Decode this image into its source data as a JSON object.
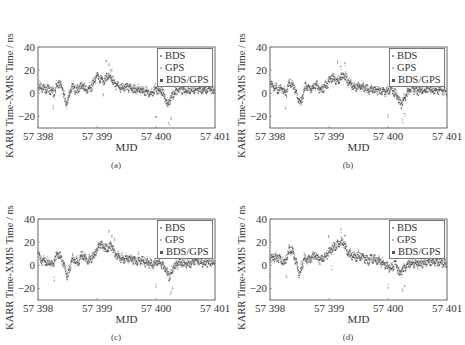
{
  "chart_data": [
    {
      "panel": "a",
      "type": "scatter",
      "caption": "(a)",
      "xlabel": "MJD",
      "ylabel": "KARR Time-XMIS Time / ns",
      "xlim": [
        57398,
        57401
      ],
      "ylim": [
        -30,
        40
      ],
      "xticks": [
        "57 398",
        "57 399",
        "57 400",
        "57 401"
      ],
      "yticks": [
        "40",
        "20",
        "0",
        "−20"
      ],
      "legend": [
        "BDS",
        "GPS",
        "BDS/GPS"
      ],
      "legend_position": "upper right",
      "grid": false,
      "trend": [
        [
          57398.0,
          6
        ],
        [
          57398.1,
          4
        ],
        [
          57398.2,
          3
        ],
        [
          57398.28,
          0
        ],
        [
          57398.33,
          9
        ],
        [
          57398.4,
          6
        ],
        [
          57398.48,
          -10
        ],
        [
          57398.58,
          6
        ],
        [
          57398.65,
          2
        ],
        [
          57398.75,
          7
        ],
        [
          57398.82,
          2
        ],
        [
          57398.9,
          5
        ],
        [
          57399.0,
          15
        ],
        [
          57399.1,
          10
        ],
        [
          57399.2,
          16
        ],
        [
          57399.3,
          8
        ],
        [
          57399.4,
          4
        ],
        [
          57399.5,
          6
        ],
        [
          57399.6,
          3
        ],
        [
          57399.7,
          3
        ],
        [
          57399.8,
          2
        ],
        [
          57399.9,
          0
        ],
        [
          57400.0,
          3
        ],
        [
          57400.1,
          2
        ],
        [
          57400.2,
          -10
        ],
        [
          57400.28,
          -2
        ],
        [
          57400.4,
          4
        ],
        [
          57400.5,
          2
        ],
        [
          57400.6,
          3
        ],
        [
          57400.7,
          4
        ],
        [
          57400.8,
          2
        ],
        [
          57400.9,
          3
        ],
        [
          57401.0,
          1
        ]
      ],
      "outliers": [
        [
          57398.26,
          -12
        ],
        [
          57399.15,
          26
        ],
        [
          57399.2,
          24
        ],
        [
          57399.25,
          21
        ],
        [
          57400.0,
          -20
        ],
        [
          57400.22,
          -26
        ],
        [
          57400.25,
          -22
        ],
        [
          57399.1,
          -2
        ]
      ]
    },
    {
      "panel": "b",
      "type": "scatter",
      "caption": "(b)",
      "xlabel": "MJD",
      "ylabel": "KARR Time-XMIS Time / ns",
      "xlim": [
        57398,
        57401
      ],
      "ylim": [
        -30,
        40
      ],
      "xticks": [
        "57 398",
        "57 399",
        "57 400",
        "57 401"
      ],
      "yticks": [
        "40",
        "20",
        "0",
        "−20"
      ],
      "legend": [
        "BDS",
        "GPS",
        "BDS/GPS"
      ],
      "legend_position": "upper right",
      "grid": false,
      "trend": [
        [
          57398.0,
          8
        ],
        [
          57398.1,
          4
        ],
        [
          57398.2,
          3
        ],
        [
          57398.28,
          0
        ],
        [
          57398.33,
          10
        ],
        [
          57398.4,
          6
        ],
        [
          57398.52,
          -10
        ],
        [
          57398.6,
          6
        ],
        [
          57398.7,
          3
        ],
        [
          57398.78,
          8
        ],
        [
          57398.85,
          3
        ],
        [
          57398.95,
          6
        ],
        [
          57399.05,
          14
        ],
        [
          57399.15,
          10
        ],
        [
          57399.25,
          16
        ],
        [
          57399.35,
          8
        ],
        [
          57399.45,
          5
        ],
        [
          57399.55,
          6
        ],
        [
          57399.65,
          3
        ],
        [
          57399.75,
          3
        ],
        [
          57399.85,
          2
        ],
        [
          57399.95,
          1
        ],
        [
          57400.05,
          3
        ],
        [
          57400.15,
          -2
        ],
        [
          57400.22,
          -10
        ],
        [
          57400.3,
          -2
        ],
        [
          57400.4,
          4
        ],
        [
          57400.5,
          2
        ],
        [
          57400.6,
          3
        ],
        [
          57400.7,
          4
        ],
        [
          57400.8,
          2
        ],
        [
          57400.9,
          3
        ],
        [
          57401.0,
          1
        ]
      ],
      "outliers": [
        [
          57398.26,
          -12
        ],
        [
          57399.15,
          26
        ],
        [
          57399.2,
          22
        ],
        [
          57399.27,
          25
        ],
        [
          57400.0,
          -20
        ],
        [
          57400.25,
          -24
        ],
        [
          57400.28,
          -18
        ],
        [
          57399.5,
          8
        ]
      ]
    },
    {
      "panel": "c",
      "type": "scatter",
      "caption": "(c)",
      "xlabel": "MJD",
      "ylabel": "KARR Time-XMIS Time / ns",
      "xlim": [
        57398,
        57401
      ],
      "ylim": [
        -30,
        40
      ],
      "xticks": [
        "57 398",
        "57 399",
        "57 400",
        "57 401"
      ],
      "yticks": [
        "40",
        "20",
        "0",
        "−20"
      ],
      "legend": [
        "BDS",
        "GPS",
        "BDS/GPS"
      ],
      "legend_position": "upper right",
      "grid": false,
      "trend": [
        [
          57398.0,
          10
        ],
        [
          57398.05,
          4
        ],
        [
          57398.15,
          3
        ],
        [
          57398.25,
          0
        ],
        [
          57398.33,
          10
        ],
        [
          57398.4,
          6
        ],
        [
          57398.5,
          -10
        ],
        [
          57398.58,
          5
        ],
        [
          57398.68,
          2
        ],
        [
          57398.75,
          9
        ],
        [
          57398.85,
          3
        ],
        [
          57398.95,
          8
        ],
        [
          57399.05,
          18
        ],
        [
          57399.15,
          14
        ],
        [
          57399.25,
          16
        ],
        [
          57399.32,
          8
        ],
        [
          57399.45,
          5
        ],
        [
          57399.55,
          6
        ],
        [
          57399.65,
          3
        ],
        [
          57399.75,
          4
        ],
        [
          57399.85,
          2
        ],
        [
          57399.95,
          1
        ],
        [
          57400.05,
          3
        ],
        [
          57400.15,
          -3
        ],
        [
          57400.22,
          -10
        ],
        [
          57400.3,
          -2
        ],
        [
          57400.4,
          2
        ],
        [
          57400.5,
          1
        ],
        [
          57400.6,
          2
        ],
        [
          57400.7,
          4
        ],
        [
          57400.8,
          2
        ],
        [
          57400.9,
          3
        ],
        [
          57401.0,
          1
        ]
      ],
      "outliers": [
        [
          57398.28,
          -12
        ],
        [
          57399.2,
          28
        ],
        [
          57399.25,
          25
        ],
        [
          57399.3,
          22
        ],
        [
          57400.0,
          -18
        ],
        [
          57400.25,
          -24
        ],
        [
          57400.28,
          -20
        ],
        [
          57399.7,
          10
        ]
      ]
    },
    {
      "panel": "d",
      "type": "scatter",
      "caption": "(d)",
      "xlabel": "MJD",
      "ylabel": "KARR Time-XMIS Time / ns",
      "xlim": [
        57398,
        57401
      ],
      "ylim": [
        -30,
        40
      ],
      "xticks": [
        "57 398",
        "57 399",
        "57 400",
        "57 401"
      ],
      "yticks": [
        "40",
        "20",
        "0",
        "−20"
      ],
      "legend": [
        "BDS",
        "GPS",
        "BDS/GPS"
      ],
      "legend_position": "upper right",
      "grid": false,
      "trend": [
        [
          57398.0,
          4
        ],
        [
          57398.05,
          7
        ],
        [
          57398.15,
          6
        ],
        [
          57398.25,
          2
        ],
        [
          57398.33,
          14
        ],
        [
          57398.4,
          10
        ],
        [
          57398.5,
          -8
        ],
        [
          57398.58,
          6
        ],
        [
          57398.68,
          4
        ],
        [
          57398.75,
          9
        ],
        [
          57398.85,
          4
        ],
        [
          57398.95,
          8
        ],
        [
          57399.05,
          14
        ],
        [
          57399.15,
          18
        ],
        [
          57399.25,
          20
        ],
        [
          57399.32,
          10
        ],
        [
          57399.45,
          7
        ],
        [
          57399.55,
          8
        ],
        [
          57399.65,
          4
        ],
        [
          57399.75,
          6
        ],
        [
          57399.85,
          3
        ],
        [
          57399.95,
          1
        ],
        [
          57400.05,
          -4
        ],
        [
          57400.12,
          2
        ],
        [
          57400.2,
          -8
        ],
        [
          57400.3,
          -1
        ],
        [
          57400.4,
          2
        ],
        [
          57400.5,
          1
        ],
        [
          57400.6,
          2
        ],
        [
          57400.7,
          4
        ],
        [
          57400.8,
          2
        ],
        [
          57400.9,
          3
        ],
        [
          57401.0,
          0
        ]
      ],
      "outliers": [
        [
          57398.0,
          -8
        ],
        [
          57398.28,
          -10
        ],
        [
          57399.0,
          25
        ],
        [
          57399.2,
          30
        ],
        [
          57399.27,
          27
        ],
        [
          57399.05,
          -2
        ],
        [
          57400.0,
          -18
        ],
        [
          57400.25,
          -22
        ],
        [
          57400.28,
          -18
        ]
      ]
    }
  ],
  "panels": {
    "a": {
      "caption": "(a)"
    },
    "b": {
      "caption": "(b)"
    },
    "c": {
      "caption": "(c)"
    },
    "d": {
      "caption": "(d)"
    }
  },
  "colors": {
    "BDS": "#9a9a9a",
    "GPS": "#b8b8b8",
    "BDS/GPS": "#555555",
    "axis": "#888888",
    "text": "#333333"
  }
}
